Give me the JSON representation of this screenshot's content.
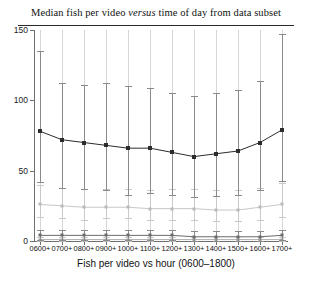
{
  "chart_data": {
    "type": "line",
    "title_prefix": "Median fish per video ",
    "title_italic": "versus",
    "title_suffix": " time of day from data subset",
    "title": "Median fish per video versus time of day from data subset",
    "xlabel": "Fish per video vs hour (0600–1800)",
    "ylabel": "",
    "ylim": [
      0,
      150
    ],
    "yticks": [
      0,
      50,
      100,
      150
    ],
    "ytick_labels": [
      "0",
      "50",
      "100",
      "150"
    ],
    "grid": false,
    "legend": "none",
    "categories": [
      "0600+",
      "0700+",
      "0800+",
      "0900+",
      "1000+",
      "1100+",
      "1200+",
      "1300+",
      "1400+",
      "1500+",
      "1600+",
      "1700+"
    ],
    "series": [
      {
        "name": "median-fish-per-video",
        "color": "#2c2c2c",
        "values": [
          78,
          72,
          70,
          68,
          66,
          66,
          63,
          60,
          62,
          64,
          70,
          79
        ],
        "err_low": [
          36,
          34,
          33,
          32,
          33,
          32,
          30,
          29,
          30,
          31,
          34,
          36
        ],
        "err_high": [
          57,
          40,
          41,
          44,
          44,
          43,
          42,
          43,
          43,
          43,
          44,
          68
        ]
      },
      {
        "name": "secondary-light-series",
        "color": "#b9b9b9",
        "values": [
          26,
          25,
          24,
          24,
          24,
          23,
          23,
          23,
          22,
          22,
          24,
          26
        ],
        "err_low": [
          9,
          9,
          9,
          8,
          8,
          8,
          8,
          8,
          8,
          8,
          9,
          9
        ],
        "err_high": [
          14,
          13,
          13,
          13,
          13,
          13,
          14,
          14,
          14,
          14,
          14,
          15
        ]
      },
      {
        "name": "baseline-series-upper",
        "color": "#6b6b6b",
        "values": [
          4,
          4,
          4,
          4,
          4,
          4,
          4,
          3,
          3,
          3,
          3,
          4
        ],
        "err_low": [
          3,
          3,
          3,
          3,
          3,
          3,
          3,
          3,
          3,
          3,
          3,
          3
        ],
        "err_high": [
          4,
          4,
          4,
          4,
          4,
          4,
          4,
          4,
          4,
          4,
          4,
          4
        ]
      },
      {
        "name": "baseline-series-lower",
        "color": "#9a9a9a",
        "values": [
          1,
          1,
          1,
          1,
          1,
          1,
          1,
          1,
          1,
          1,
          1,
          1
        ],
        "err_low": [
          1,
          1,
          1,
          1,
          1,
          1,
          1,
          1,
          1,
          1,
          1,
          1
        ],
        "err_high": [
          2,
          2,
          2,
          2,
          2,
          2,
          2,
          2,
          2,
          2,
          2,
          2
        ]
      }
    ]
  }
}
